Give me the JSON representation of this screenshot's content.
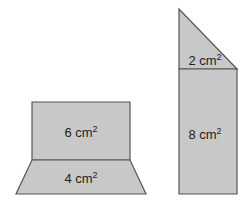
{
  "figure": {
    "left_shape": {
      "rectangle": {
        "area_value": "6 cm",
        "exponent": "2"
      },
      "trapezoid": {
        "area_value": "4 cm",
        "exponent": "2"
      }
    },
    "right_shape": {
      "triangle": {
        "area_value": "2 cm",
        "exponent": "2"
      },
      "rectangle": {
        "area_value": "8 cm",
        "exponent": "2"
      }
    },
    "colors": {
      "fill": "#c8c8c8",
      "stroke": "#555555"
    }
  }
}
